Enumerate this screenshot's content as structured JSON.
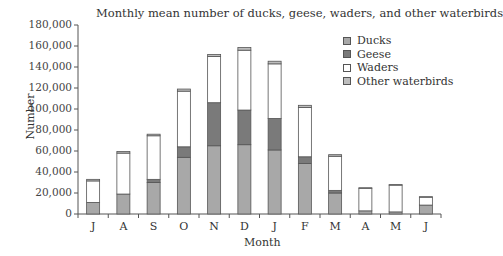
{
  "chart_data": {
    "type": "bar",
    "stacked": true,
    "title": "Monthly mean number of ducks, geese, waders, and other waterbirds",
    "xlabel": "Month",
    "ylabel": "Number",
    "ylim": [
      0,
      180000
    ],
    "yticks": [
      0,
      20000,
      40000,
      60000,
      80000,
      100000,
      120000,
      140000,
      160000,
      180000
    ],
    "ytick_labels": [
      "0",
      "20,000",
      "40,000",
      "60,000",
      "80,000",
      "100,000",
      "120,000",
      "140,000",
      "160,000",
      "180,000"
    ],
    "categories": [
      "J",
      "A",
      "S",
      "O",
      "N",
      "D",
      "J",
      "F",
      "M",
      "A",
      "M",
      "J"
    ],
    "series": [
      {
        "name": "Ducks",
        "color": "#a8a8a8",
        "values": [
          11000,
          19000,
          30000,
          54000,
          65000,
          66000,
          61000,
          48000,
          20000,
          3000,
          2000,
          8500
        ]
      },
      {
        "name": "Geese",
        "color": "#7a7a7a",
        "values": [
          0,
          0,
          3000,
          10000,
          41000,
          33000,
          30000,
          6500,
          2500,
          0,
          0,
          0
        ]
      },
      {
        "name": "Waders",
        "color": "#ffffff",
        "values": [
          20500,
          39000,
          41500,
          53000,
          44000,
          57000,
          52000,
          47000,
          32500,
          21500,
          25500,
          7500
        ]
      },
      {
        "name": "Other waterbirds",
        "color": "#bdbdbd",
        "values": [
          1500,
          1500,
          1500,
          2000,
          2000,
          2500,
          2500,
          2000,
          1500,
          500,
          500,
          500
        ]
      }
    ],
    "grid": false,
    "legend_position": "upper right"
  },
  "legend": {
    "items": [
      {
        "label": "Ducks",
        "color": "#a8a8a8"
      },
      {
        "label": "Geese",
        "color": "#7a7a7a"
      },
      {
        "label": "Waders",
        "color": "#ffffff"
      },
      {
        "label": "Other waterbirds",
        "color": "#bdbdbd"
      }
    ]
  }
}
